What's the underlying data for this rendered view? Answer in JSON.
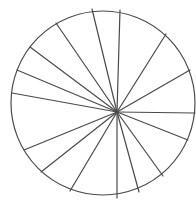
{
  "diagram": {
    "type": "circle-divided-into-sectors",
    "background": "#ffffff",
    "stroke_color": "#4a4a4a",
    "stroke_width": 1.2,
    "circle": {
      "cx": 103,
      "cy": 103,
      "r": 92
    },
    "hub": {
      "x": 117,
      "y": 112
    },
    "sector_count": 16,
    "spoke_endpoints": [
      {
        "x": 92,
        "y": 9
      },
      {
        "x": 120,
        "y": 10
      },
      {
        "x": 166,
        "y": 34
      },
      {
        "x": 190,
        "y": 70
      },
      {
        "x": 195,
        "y": 113
      },
      {
        "x": 188,
        "y": 140
      },
      {
        "x": 163,
        "y": 176
      },
      {
        "x": 139,
        "y": 192
      },
      {
        "x": 117,
        "y": 198
      },
      {
        "x": 70,
        "y": 191
      },
      {
        "x": 41,
        "y": 172
      },
      {
        "x": 24,
        "y": 150
      },
      {
        "x": 12,
        "y": 93
      },
      {
        "x": 17,
        "y": 70
      },
      {
        "x": 30,
        "y": 47
      },
      {
        "x": 56,
        "y": 23
      }
    ]
  }
}
